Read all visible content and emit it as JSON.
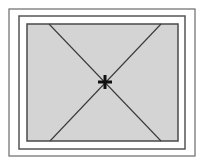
{
  "diagram": {
    "colors": {
      "background": "#ffffff",
      "frame_outer": "#6a6a6a",
      "frame_middle": "#555555",
      "frame_inner": "#4a4a4a",
      "pane_fill": "#d4d4d4",
      "diagonal": "#3a3a3a",
      "center_marker": "#111111"
    },
    "frames": {
      "outer": {
        "x": 9,
        "y": 9,
        "w": 186,
        "h": 147
      },
      "middle": {
        "x": 19,
        "y": 16,
        "w": 166,
        "h": 133
      },
      "inner": {
        "x": 27,
        "y": 24,
        "w": 151,
        "h": 117
      }
    },
    "diagonals": [
      {
        "x1": 49,
        "y1": 24,
        "x2": 161,
        "y2": 141
      },
      {
        "x1": 161,
        "y1": 24,
        "x2": 50,
        "y2": 141
      }
    ],
    "center": {
      "x": 105,
      "y": 82,
      "size": 7
    }
  }
}
